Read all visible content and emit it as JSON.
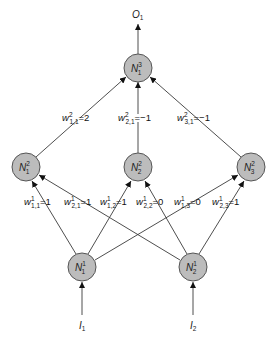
{
  "diagram": {
    "title": "",
    "colors": {
      "node_fill": "#bcbcbc",
      "node_stroke": "#555555",
      "edge": "#3a3a3a",
      "background": "#ffffff"
    },
    "output": {
      "label": "O",
      "sub": "1"
    },
    "inputs": [
      {
        "label": "I",
        "sub": "1"
      },
      {
        "label": "I",
        "sub": "2"
      }
    ],
    "nodes": {
      "layer3": [
        {
          "id": "N31",
          "label": "N",
          "sup": "3",
          "sub": "1"
        }
      ],
      "layer2": [
        {
          "id": "N21",
          "label": "N",
          "sup": "2",
          "sub": "1"
        },
        {
          "id": "N22",
          "label": "N",
          "sup": "2",
          "sub": "2"
        },
        {
          "id": "N23",
          "label": "N",
          "sup": "2",
          "sub": "3"
        }
      ],
      "layer1": [
        {
          "id": "N11",
          "label": "N",
          "sup": "1",
          "sub": "1"
        },
        {
          "id": "N12",
          "label": "N",
          "sup": "1",
          "sub": "2"
        }
      ]
    },
    "weights_layer2": [
      {
        "w": "w",
        "sup": "2",
        "sub": "1,1",
        "value": "=2"
      },
      {
        "w": "w",
        "sup": "2",
        "sub": "2,1",
        "value": "=−1"
      },
      {
        "w": "w",
        "sup": "2",
        "sub": "3,1",
        "value": "=−1"
      }
    ],
    "weights_layer1": [
      {
        "w": "w",
        "sup": "1",
        "sub": "1,1",
        "value": "=1"
      },
      {
        "w": "w",
        "sup": "1",
        "sub": "2,1",
        "value": "=1"
      },
      {
        "w": "w",
        "sup": "1",
        "sub": "1,2",
        "value": "=1"
      },
      {
        "w": "w",
        "sup": "1",
        "sub": "2,2",
        "value": "=0"
      },
      {
        "w": "w",
        "sup": "1",
        "sub": "1,3",
        "value": "=0"
      },
      {
        "w": "w",
        "sup": "1",
        "sub": "2,3",
        "value": "=1"
      }
    ]
  }
}
